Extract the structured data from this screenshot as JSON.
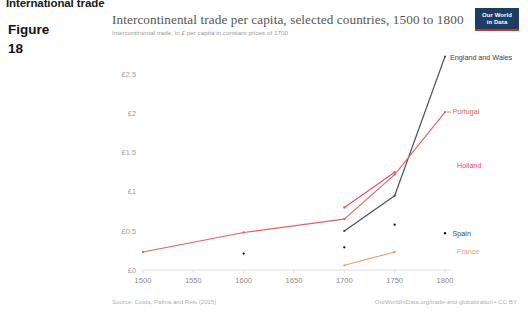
{
  "page": {
    "running_head": "International trade",
    "figure_word": "Figure",
    "figure_number": "18"
  },
  "logo": {
    "line1": "Our World",
    "line2": "in Data",
    "bg_color": "#1d3d63",
    "accent_color": "#c0392b"
  },
  "header": {
    "title": "Intercontinental trade per capita, selected countries, 1500 to 1800",
    "subtitle": "Intercontinental trade, in £ per capita in constant prices of 1700"
  },
  "footer": {
    "source": "Source: Costa, Palma and Reis (2015)",
    "credit": "OurWorldInData.org/trade-and-globalization • CC BY"
  },
  "axis": {
    "y_ticks": [
      "£0",
      "£0.5",
      "£1",
      "£1.5",
      "£2",
      "£2.5"
    ],
    "x_ticks": [
      "1500",
      "1550",
      "1600",
      "1650",
      "1700",
      "1750",
      "1800"
    ]
  },
  "chart_data": {
    "type": "line",
    "title": "Intercontinental trade per capita, selected countries, 1500 to 1800",
    "subtitle": "Intercontinental trade, in £ per capita in constant prices of 1700",
    "xlabel": "",
    "ylabel": "£ per capita (constant 1700 prices)",
    "xlim": [
      1500,
      1800
    ],
    "ylim": [
      0,
      2.75
    ],
    "ytick_values": [
      0,
      0.5,
      1,
      1.5,
      2,
      2.5
    ],
    "xtick_values": [
      1500,
      1550,
      1600,
      1650,
      1700,
      1750,
      1800
    ],
    "grid": false,
    "legend": "series-end-labels",
    "series": [
      {
        "name": "England and Wales",
        "color": "#4a4a5e",
        "label_color": "#3b3b4a",
        "points": [
          {
            "x": 1700,
            "y": 0.5
          },
          {
            "x": 1750,
            "y": 0.95
          },
          {
            "x": 1800,
            "y": 2.73
          }
        ]
      },
      {
        "name": "Portugal",
        "color": "#e8615f",
        "label_color": "#e8615f",
        "points": [
          {
            "x": 1500,
            "y": 0.23
          },
          {
            "x": 1600,
            "y": 0.48
          },
          {
            "x": 1700,
            "y": 0.65
          },
          {
            "x": 1750,
            "y": 1.22
          },
          {
            "x": 1800,
            "y": 2.02
          }
        ]
      },
      {
        "name": "Holland",
        "color": "#ef4a6b",
        "label_color": "#ef4a6b",
        "points": [
          {
            "x": 1700,
            "y": 0.8
          },
          {
            "x": 1750,
            "y": 1.25
          }
        ]
      },
      {
        "name": "Spain",
        "color": "#2a5council",
        "label_color": "#38504f",
        "points": [
          {
            "x": 1600,
            "y": 0.21
          },
          {
            "x": 1700,
            "y": 0.29
          },
          {
            "x": 1750,
            "y": 0.58
          },
          {
            "x": 1800,
            "y": 0.47
          }
        ]
      },
      {
        "name": "France",
        "color": "#f09a68",
        "label_color": "#f0a070",
        "points": [
          {
            "x": 1700,
            "y": 0.06
          },
          {
            "x": 1750,
            "y": 0.23
          }
        ]
      }
    ]
  },
  "series_labels": [
    {
      "name": "England and Wales"
    },
    {
      "name": "Portugal"
    },
    {
      "name": "Holland"
    },
    {
      "name": "Spain"
    },
    {
      "name": "France"
    }
  ]
}
